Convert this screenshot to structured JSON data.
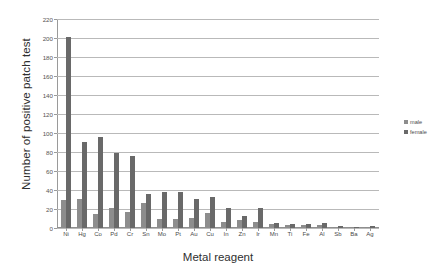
{
  "chart_data": {
    "type": "bar",
    "title": "",
    "xlabel": "Metal reagent",
    "ylabel": "Number of positive patch test",
    "ylim": [
      0,
      220
    ],
    "ytick_step": 20,
    "yticks": [
      0,
      20,
      40,
      60,
      80,
      100,
      120,
      140,
      160,
      180,
      200,
      220
    ],
    "grid": true,
    "legend_position": "right",
    "categories": [
      "Ni",
      "Hg",
      "Co",
      "Pd",
      "Cr",
      "Sn",
      "Mo",
      "Pt",
      "Au",
      "Cu",
      "In",
      "Zn",
      "Ir",
      "Mn",
      "Ti",
      "Fe",
      "Al",
      "Sb",
      "Ba",
      "Ag"
    ],
    "series": [
      {
        "name": "male",
        "color": "#8d8d8d",
        "values": [
          29,
          31,
          15,
          21,
          17,
          26,
          10,
          10,
          11,
          16,
          6,
          8,
          6,
          4,
          3,
          3,
          3,
          1,
          1,
          1
        ]
      },
      {
        "name": "female",
        "color": "#696969",
        "values": [
          201,
          91,
          96,
          79,
          76,
          36,
          38,
          38,
          31,
          33,
          21,
          13,
          21,
          5,
          4,
          4,
          5,
          2,
          1,
          2
        ]
      }
    ]
  },
  "axes": {
    "y_title": "Number of positive patch test",
    "x_title": "Metal reagent"
  },
  "legend": {
    "items": [
      {
        "label": "male",
        "swatch": "male-swatch"
      },
      {
        "label": "female",
        "swatch": "female-swatch"
      }
    ]
  }
}
